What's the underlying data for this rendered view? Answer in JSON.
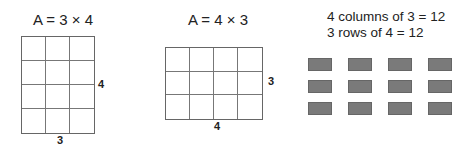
{
  "panels": [
    {
      "title": "A = 3 × 4",
      "columns": 3,
      "rows": 4,
      "width_label": "3",
      "height_label": "4"
    },
    {
      "title": "A = 4 × 3",
      "columns": 4,
      "rows": 3,
      "width_label": "4",
      "height_label": "3"
    },
    {
      "statements": [
        "4 columns of 3 = 12",
        "3 rows of 4 = 12"
      ],
      "array": {
        "columns": 4,
        "rows": 3,
        "color": "#7a7a7a"
      }
    }
  ]
}
